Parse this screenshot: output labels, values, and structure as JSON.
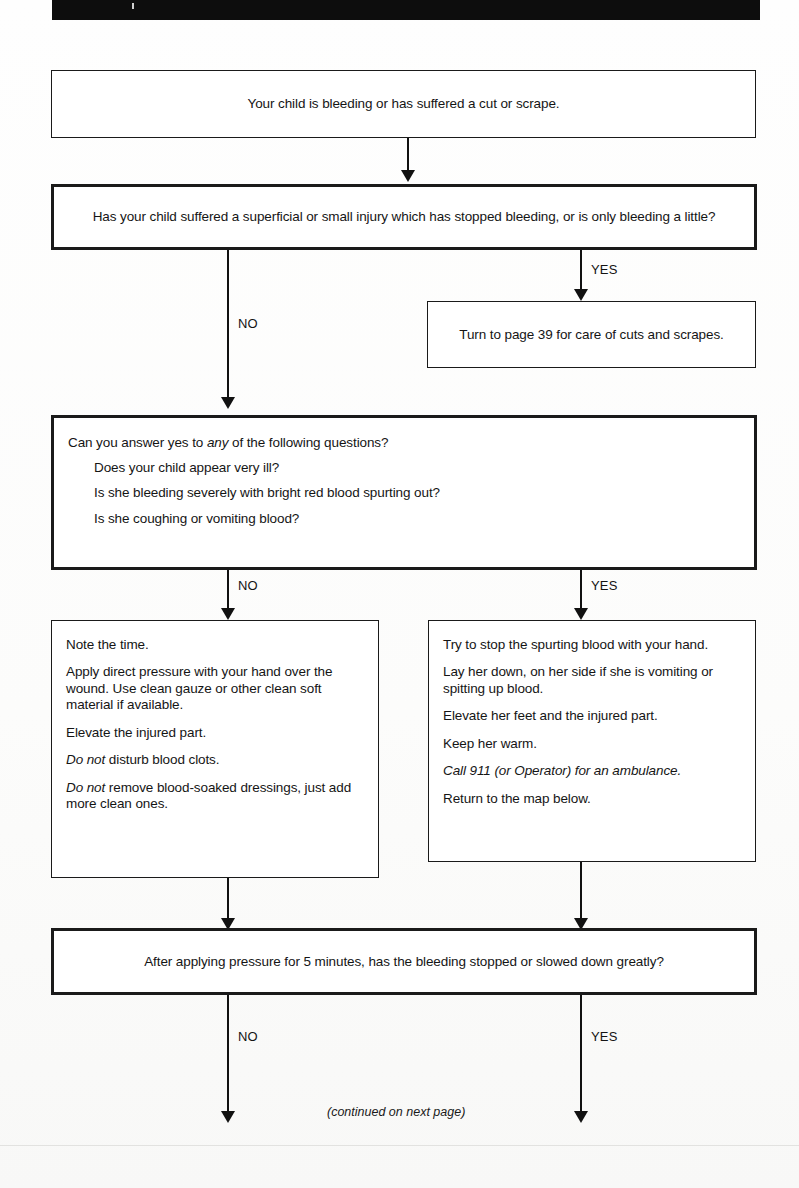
{
  "header": {
    "bar_label": ""
  },
  "flowchart": {
    "title": "Bleeding / cuts and scrapes decision map",
    "nodes": {
      "start": {
        "text": "Your child is bleeding or has suffered a cut or scrape."
      },
      "q_superficial": {
        "text": "Has your child suffered a superficial or small injury which has stopped bleeding, or is only bleeding a little?"
      },
      "turn_to_page": {
        "text": "Turn to page 39 for care of cuts and scrapes."
      },
      "q_any": {
        "lead_pre": "Can you answer yes to ",
        "lead_em": "any",
        "lead_post": " of the following questions?",
        "items": [
          "Does your child appear very ill?",
          "Is she bleeding severely with bright red blood spurting out?",
          "Is she coughing or vomiting blood?"
        ]
      },
      "steps_no": {
        "steps": [
          {
            "text": "Note the time."
          },
          {
            "text": "Apply direct pressure with your hand over the wound. Use clean gauze or other clean soft material if available."
          },
          {
            "text": "Elevate the injured part."
          },
          {
            "em_lead": "Do not",
            "text": " disturb blood clots."
          },
          {
            "em_lead": "Do not",
            "text": " remove blood-soaked dressings, just add more clean ones."
          }
        ]
      },
      "steps_yes": {
        "steps": [
          {
            "text": "Try to stop the spurting blood with your hand."
          },
          {
            "text": "Lay her down, on her side if she is vomiting or spitting up blood."
          },
          {
            "text": "Elevate her feet and the injured part."
          },
          {
            "text": "Keep her warm."
          },
          {
            "em_all": "Call 911 (or Operator) for an ambulance."
          },
          {
            "text": "Return to the map below."
          }
        ]
      },
      "q_after_pressure": {
        "text": "After applying pressure for 5 minutes, has the bleeding stopped or slowed down greatly?"
      }
    },
    "edge_labels": {
      "q1_yes": "YES",
      "q1_no": "NO",
      "q2_no": "NO",
      "q2_yes": "YES",
      "q3_no": "NO",
      "q3_yes": "YES"
    },
    "footnote": "(continued on next page)"
  },
  "colors": {
    "ink": "#151515",
    "paper": "#fdfdfc",
    "header_bar": "#0d0d0d"
  }
}
